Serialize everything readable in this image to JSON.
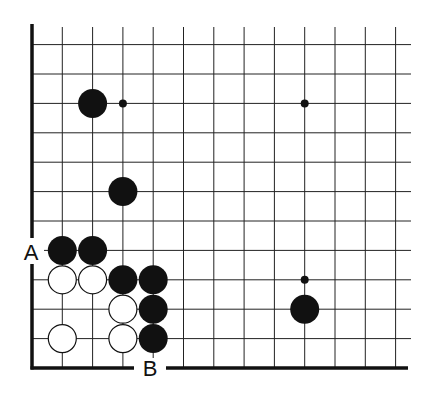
{
  "diagram": {
    "type": "go-board-corner",
    "colors": {
      "background": "#ffffff",
      "line": "#222222",
      "edge": "#111111",
      "black_stone": "#111111",
      "white_stone": "#ffffff",
      "white_stone_outline": "#111111"
    },
    "grid": {
      "columns": 13,
      "rows": 12,
      "edges_shown": [
        "left",
        "bottom"
      ]
    },
    "stones": [
      {
        "color": "black",
        "col": 2,
        "row": 9
      },
      {
        "color": "black",
        "col": 3,
        "row": 6
      },
      {
        "color": "black",
        "col": 1,
        "row": 4
      },
      {
        "color": "black",
        "col": 2,
        "row": 4
      },
      {
        "color": "white",
        "col": 1,
        "row": 3
      },
      {
        "color": "white",
        "col": 2,
        "row": 3
      },
      {
        "color": "black",
        "col": 3,
        "row": 3
      },
      {
        "color": "black",
        "col": 4,
        "row": 3
      },
      {
        "color": "white",
        "col": 3,
        "row": 2
      },
      {
        "color": "black",
        "col": 4,
        "row": 2
      },
      {
        "color": "white",
        "col": 1,
        "row": 1
      },
      {
        "color": "white",
        "col": 3,
        "row": 1
      },
      {
        "color": "black",
        "col": 4,
        "row": 1
      },
      {
        "color": "black",
        "col": 9,
        "row": 2
      }
    ],
    "markers": [
      {
        "type": "small-dot",
        "col": 3,
        "row": 9
      },
      {
        "type": "small-dot",
        "col": 9,
        "row": 9
      },
      {
        "type": "small-dot",
        "col": 9,
        "row": 3
      }
    ],
    "labels": {
      "A": "A",
      "B": "B"
    }
  }
}
